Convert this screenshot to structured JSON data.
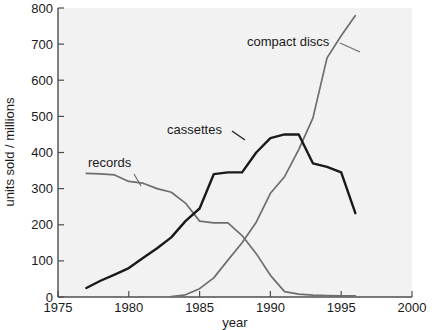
{
  "chart_data": {
    "type": "line",
    "title": "",
    "xlabel": "year",
    "ylabel": "units sold / millions",
    "xlim": [
      1975,
      2000
    ],
    "ylim": [
      0,
      800
    ],
    "xticks": [
      1975,
      1980,
      1985,
      1990,
      1995,
      2000
    ],
    "xtick_labels": [
      "1975",
      "1980",
      "1985",
      "1990",
      "1995",
      "2000"
    ],
    "yticks": [
      0,
      100,
      200,
      300,
      400,
      500,
      600,
      700,
      800
    ],
    "ytick_labels": [
      "0",
      "100",
      "200",
      "300",
      "400",
      "500",
      "600",
      "700",
      "800"
    ],
    "grid": false,
    "legend": "inline-annotations",
    "series": [
      {
        "name": "records",
        "color": "#6e6e6e",
        "label_text": "records",
        "x": [
          1977,
          1978,
          1979,
          1980,
          1981,
          1982,
          1983,
          1984,
          1985,
          1986,
          1987,
          1988,
          1989,
          1990,
          1991,
          1992,
          1993,
          1994,
          1995,
          1996
        ],
        "values": [
          342,
          341,
          338,
          320,
          315,
          300,
          290,
          260,
          210,
          205,
          205,
          170,
          120,
          60,
          15,
          8,
          5,
          4,
          3,
          3
        ]
      },
      {
        "name": "cassettes",
        "color": "#1a1a1a",
        "label_text": "cassettes",
        "x": [
          1977,
          1978,
          1979,
          1980,
          1981,
          1982,
          1983,
          1984,
          1985,
          1986,
          1987,
          1988,
          1989,
          1990,
          1991,
          1992,
          1993,
          1994,
          1995,
          1996
        ],
        "values": [
          25,
          45,
          62,
          80,
          108,
          135,
          165,
          210,
          245,
          340,
          345,
          345,
          400,
          440,
          450,
          450,
          370,
          360,
          345,
          340
        ]
      },
      {
        "name": "compact discs",
        "color": "#6e6e6e",
        "label_text": "compact discs",
        "x": [
          1983,
          1984,
          1985,
          1986,
          1987,
          1988,
          1989,
          1990,
          1991,
          1992,
          1993,
          1994,
          1995,
          1996
        ],
        "values": [
          1,
          6,
          23,
          53,
          102,
          150,
          207,
          287,
          333,
          408,
          495,
          662,
          723,
          779
        ]
      }
    ],
    "cassettes_tail": {
      "x": [
        1992,
        1993,
        1994,
        1995,
        1996
      ],
      "values": [
        450,
        370,
        360,
        345,
        232
      ]
    }
  },
  "annotations": [
    {
      "name": "records-label",
      "text": "records"
    },
    {
      "name": "cassettes-label",
      "text": "cassettes"
    },
    {
      "name": "compact-discs-label",
      "text": "compact discs"
    }
  ]
}
